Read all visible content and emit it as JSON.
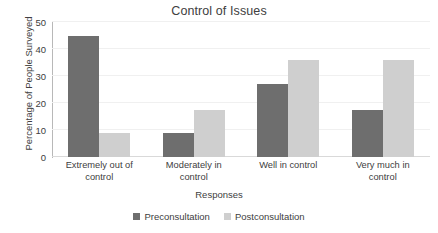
{
  "chart_data": {
    "type": "bar",
    "title": "Control of Issues",
    "xlabel": "Responses",
    "ylabel": "Percentage of People Surveyed",
    "categories": [
      "Extremely out of control",
      "Moderately in control",
      "Well in control",
      "Very much in control"
    ],
    "category_lines": [
      [
        "Extremely out of",
        "control"
      ],
      [
        "Moderately in",
        "control"
      ],
      [
        "Well in control",
        ""
      ],
      [
        "Very much in",
        "control"
      ]
    ],
    "series": [
      {
        "name": "Preconsultation",
        "color": "#6e6e6e",
        "values": [
          45,
          9,
          27,
          17.5
        ]
      },
      {
        "name": "Postconsultation",
        "color": "#cfcfcf",
        "values": [
          9,
          17.5,
          36,
          36
        ]
      }
    ],
    "ylim": [
      0,
      50
    ],
    "yticks": [
      0,
      10,
      20,
      30,
      40,
      50
    ],
    "ytick_labels": [
      "0",
      "10",
      "20",
      "30",
      "40",
      "50"
    ],
    "grid": true,
    "grid_axis": "y",
    "legend_position": "bottom",
    "background": "#ffffff"
  },
  "legend": {
    "items": [
      {
        "label": "Preconsultation",
        "color": "#6e6e6e"
      },
      {
        "label": "Postconsultation",
        "color": "#cfcfcf"
      }
    ]
  }
}
